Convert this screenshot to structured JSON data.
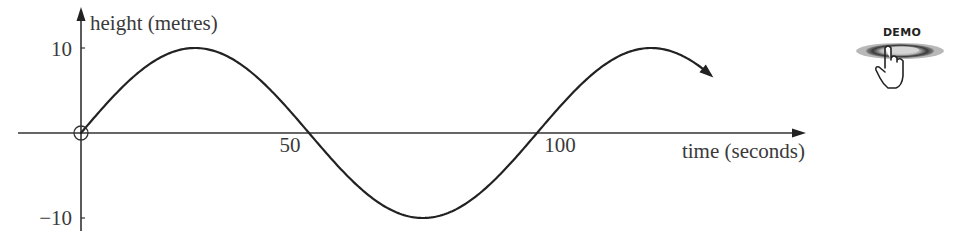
{
  "chart_data": {
    "type": "line",
    "title": "",
    "xlabel": "time (seconds)",
    "ylabel": "height (metres)",
    "x_ticks": [
      50,
      100
    ],
    "x_tick_labels": [
      "50",
      "100"
    ],
    "y_ticks": [
      10,
      -10
    ],
    "y_tick_labels": [
      "10",
      "−10"
    ],
    "xlim": [
      -14,
      158
    ],
    "ylim": [
      -11.5,
      14.8
    ],
    "grid": false,
    "legend": null,
    "origin_marker": "open-circle",
    "series": [
      {
        "name": "height",
        "function": "10*sin(2*pi*t/100)",
        "amplitude": 10,
        "period": 100,
        "t_start": 0,
        "t_end": 138,
        "end_arrow": true,
        "x": [
          0,
          12.5,
          25,
          37.5,
          50,
          62.5,
          75,
          87.5,
          100,
          112.5,
          125,
          138
        ],
        "values": [
          0,
          7.07,
          10,
          7.07,
          0,
          -7.07,
          -10,
          -7.07,
          0,
          7.07,
          10,
          7.29
        ]
      }
    ]
  },
  "axes": {
    "y_label": "height (metres)",
    "x_label": "time (seconds)",
    "y_tick_top": "10",
    "y_tick_bottom": "−10",
    "x_tick_50": "50",
    "x_tick_100": "100"
  },
  "demo_button": {
    "label": "DEMO",
    "icon": "hand-pointer-icon"
  }
}
